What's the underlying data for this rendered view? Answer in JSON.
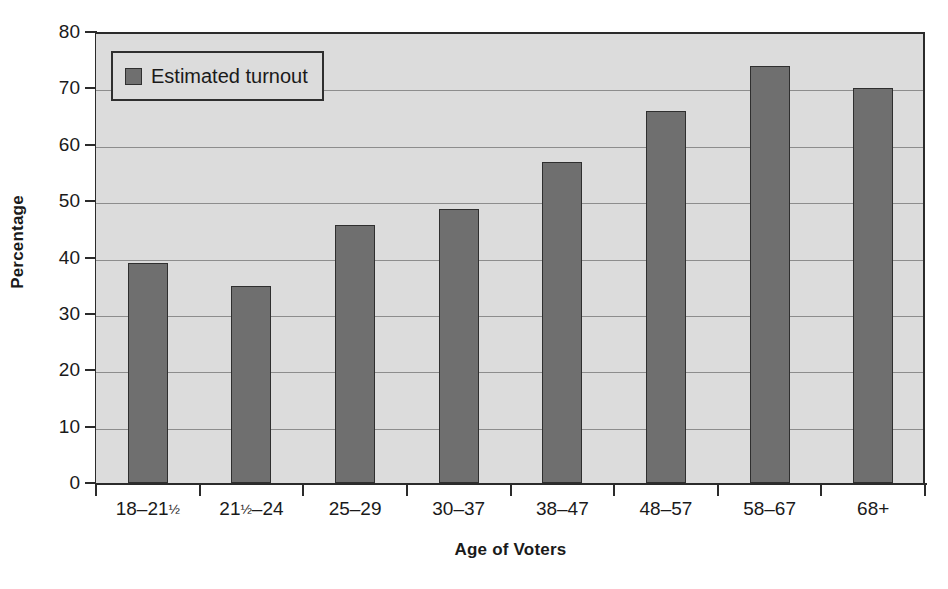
{
  "chart_data": {
    "type": "bar",
    "title": "",
    "xlabel": "Age of Voters",
    "ylabel": "Percentage",
    "ylim": [
      0,
      80
    ],
    "ytick_step": 10,
    "yticks": [
      "0",
      "10",
      "20",
      "30",
      "40",
      "50",
      "60",
      "70",
      "80"
    ],
    "grid": "horizontal",
    "legend_position": "top-left",
    "categories": [
      "18–21½",
      "21½–24",
      "25–29",
      "30–37",
      "38–47",
      "48–57",
      "58–67",
      "68+"
    ],
    "category_parts": [
      {
        "pre": "18–21",
        "frac": "½",
        "post": ""
      },
      {
        "pre": "21",
        "frac": "½",
        "post": "–24"
      },
      {
        "pre": "25–29",
        "frac": "",
        "post": ""
      },
      {
        "pre": "30–37",
        "frac": "",
        "post": ""
      },
      {
        "pre": "38–47",
        "frac": "",
        "post": ""
      },
      {
        "pre": "48–57",
        "frac": "",
        "post": ""
      },
      {
        "pre": "58–67",
        "frac": "",
        "post": ""
      },
      {
        "pre": "68+",
        "frac": "",
        "post": ""
      }
    ],
    "series": [
      {
        "name": "Estimated turnout",
        "values": [
          39,
          35,
          45.7,
          48.6,
          57,
          66,
          74,
          70
        ]
      }
    ]
  },
  "legend": {
    "entries": [
      {
        "label": "Estimated turnout",
        "color": "#6f6f6f"
      }
    ]
  },
  "colors": {
    "bar_fill": "#6f6f6f",
    "bar_border": "#2f2f2f",
    "plot_background": "#dcdcdc",
    "gridline": "#8d8d8d",
    "axis": "#2b2b2b",
    "page_background": "#ffffff",
    "text": "#1a1a1a"
  }
}
